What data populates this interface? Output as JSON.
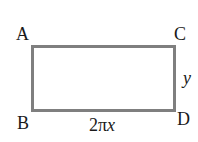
{
  "diagram": {
    "shape": "rectangle",
    "stroke_color": "#7f7f7f",
    "vertices": {
      "top_left": "A",
      "bottom_left": "B",
      "top_right": "C",
      "bottom_right": "D"
    },
    "side_labels": {
      "bottom": "2πx",
      "right": "y"
    }
  }
}
